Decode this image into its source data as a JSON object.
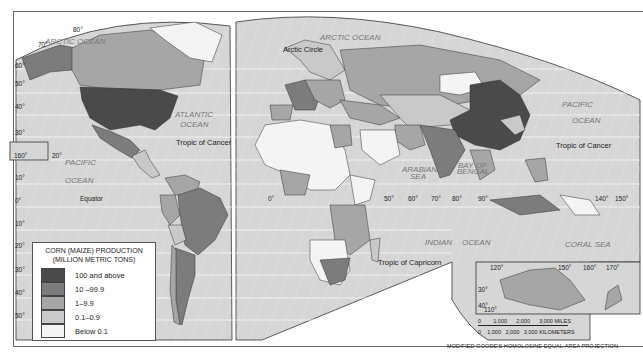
{
  "map": {
    "title": "Corn (Maize) Production",
    "projection": "MODIFIED GOODE'S HOMOLOSINE EQUAL-AREA PROJECTION",
    "legend": {
      "title_line1": "CORN (MAIZE) PRODUCTION",
      "title_line2": "(MILLION METRIC TONS)",
      "classes": [
        {
          "label": "100 and above",
          "color": "#4a4a4a"
        },
        {
          "label": "10 –99.9",
          "color": "#7c7c7c"
        },
        {
          "label": "1–9.9",
          "color": "#a6a6a6"
        },
        {
          "label": "0.1–0.9",
          "color": "#c9c9c9"
        },
        {
          "label": "Below 0.1",
          "color": "#f4f4f4"
        }
      ]
    },
    "labels": {
      "arctic_ocean_w": "ARCTIC OCEAN",
      "arctic_ocean_e": "ARCTIC OCEAN",
      "arctic_circle": "Arctic Circle",
      "atlantic_1": "ATLANTIC",
      "atlantic_2": "OCEAN",
      "pacific_w1": "PACIFIC",
      "pacific_w2": "OCEAN",
      "pacific_e1": "PACIFIC",
      "pacific_e2": "OCEAN",
      "indian_1": "INDIAN",
      "indian_2": "OCEAN",
      "arabian_1": "ARABIAN",
      "arabian_2": "SEA",
      "bengal_1": "BAY OF",
      "bengal_2": "BENGAL",
      "coral_sea": "CORAL SEA",
      "tropic_cancer_w": "Tropic of Cancer",
      "tropic_cancer_e": "Tropic of Cancer",
      "equator": "Equator",
      "tropic_capricorn": "Tropic of Capricorn"
    },
    "lat_left": [
      "80°",
      "70°",
      "60°",
      "50°",
      "40°",
      "30°",
      "20°",
      "10°",
      "0°",
      "10°",
      "20°",
      "30°",
      "40°",
      "50°"
    ],
    "lon_labels_middle": [
      "0°",
      "50°",
      "60°",
      "70°",
      "80°",
      "90°",
      "140°",
      "150°"
    ],
    "inset_top_lon": [
      "120°",
      "150°",
      "160°",
      "170°"
    ],
    "inset_bottom_lon": [
      "110°",
      "120°",
      "130°",
      "140°",
      "150°",
      "160°",
      "180°"
    ],
    "inset_lat": [
      "20°",
      "30°",
      "40°"
    ],
    "hawaii_lon": "160°",
    "scale": {
      "miles": "0        1,000      2,000      3,000 MILES",
      "km": "0    1,000   2,000   3,000 KILOMETERS"
    }
  }
}
